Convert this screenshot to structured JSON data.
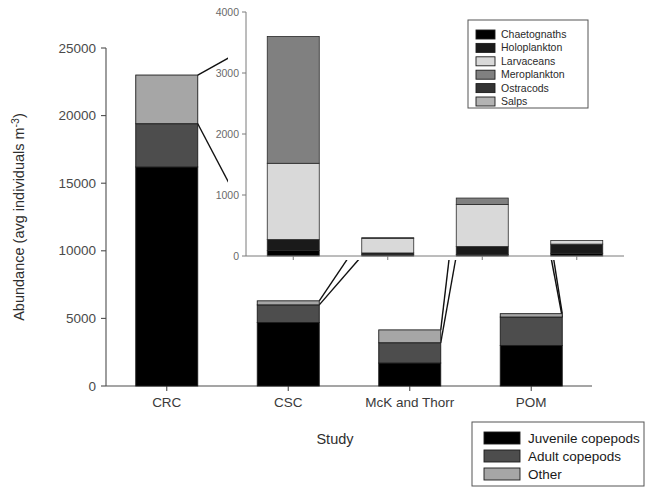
{
  "chart_data": {
    "type": "bar",
    "title": "",
    "subtitle": "",
    "xlabel": "Study",
    "ylabel": "Abundance (avg individuals m-3)",
    "ylabel_base": "Abundance (avg individuals m",
    "ylabel_sup": "-3",
    "ylabel_tail": ")",
    "stacked": true,
    "grid": false,
    "categories": [
      "CRC",
      "CSC",
      "McK and Thorr",
      "POM"
    ],
    "ylim": [
      0,
      25000
    ],
    "yticks": [
      0,
      5000,
      10000,
      15000,
      20000,
      25000
    ],
    "yticklabels": [
      "0",
      "5000",
      "10000",
      "15000",
      "20000",
      "25000"
    ],
    "series": [
      {
        "name": "Juvenile copepods",
        "color": "#000000",
        "values": [
          16200,
          4700,
          1700,
          3000
        ]
      },
      {
        "name": "Adult copepods",
        "color": "#4d4d4d",
        "values": [
          3200,
          1300,
          1500,
          2100
        ]
      },
      {
        "name": "Other",
        "color": "#a6a6a6",
        "values": [
          3600,
          300,
          950,
          250
        ]
      }
    ],
    "totals": [
      23000,
      6300,
      4150,
      5350
    ],
    "legend_position": "bottom-right",
    "legend_entries": [
      {
        "label": "Juvenile copepods",
        "color": "#000000"
      },
      {
        "label": "Adult copepods",
        "color": "#4d4d4d"
      },
      {
        "label": "Other",
        "color": "#a6a6a6"
      }
    ],
    "inset": {
      "type": "bar",
      "stacked": true,
      "description": "Breakdown of the Other category per study",
      "categories": [
        "CRC",
        "CSC",
        "McK and Thorr",
        "POM"
      ],
      "ylim": [
        0,
        4000
      ],
      "yticks": [
        0,
        1000,
        2000,
        3000,
        4000
      ],
      "yticklabels": [
        "0",
        "1000",
        "2000",
        "3000",
        "4000"
      ],
      "legend_position": "top-right",
      "series": [
        {
          "name": "Chaetognaths",
          "color": "#000000",
          "values": [
            90,
            20,
            25,
            45
          ]
        },
        {
          "name": "Holoplankton",
          "color": "#1a1a1a",
          "values": [
            180,
            30,
            130,
            150
          ]
        },
        {
          "name": "Larvaceans",
          "color": "#d9d9d9",
          "values": [
            1250,
            240,
            690,
            60
          ]
        },
        {
          "name": "Meroplankton",
          "color": "#808080",
          "values": [
            2080,
            10,
            105,
            0
          ]
        },
        {
          "name": "Ostracods",
          "color": "#333333",
          "values": [
            0,
            0,
            0,
            0
          ]
        },
        {
          "name": "Salps",
          "color": "#b3b3b3",
          "values": [
            0,
            0,
            0,
            0
          ]
        }
      ],
      "totals": [
        3600,
        300,
        950,
        255
      ],
      "legend_entries": [
        {
          "label": "Chaetognaths",
          "color": "#000000"
        },
        {
          "label": "Holoplankton",
          "color": "#1a1a1a"
        },
        {
          "label": "Larvaceans",
          "color": "#d9d9d9"
        },
        {
          "label": "Meroplankton",
          "color": "#808080"
        },
        {
          "label": "Ostracods",
          "color": "#333333"
        },
        {
          "label": "Salps",
          "color": "#b3b3b3"
        }
      ]
    }
  }
}
